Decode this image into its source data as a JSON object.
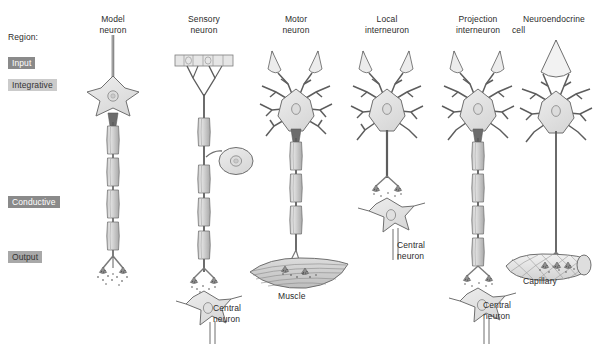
{
  "figure": {
    "title_prefix": "Region:",
    "background_color": "#ffffff",
    "ink_color": "#4a4a4a",
    "soma_fill": "#e2e2e2",
    "myelin_fill": "#cfcfcf"
  },
  "regions": [
    {
      "key": "input",
      "label": "Input",
      "chip_color": "#8a8a8a",
      "text_color": "#ffffff",
      "x": 8,
      "y": 57
    },
    {
      "key": "integrative",
      "label": "Integrative",
      "chip_color": "#cbcbcb",
      "text_color": "#333333",
      "x": 8,
      "y": 79
    },
    {
      "key": "conductive",
      "label": "Conductive",
      "chip_color": "#8a8a8a",
      "text_color": "#ffffff",
      "x": 8,
      "y": 196
    },
    {
      "key": "output",
      "label": "Output",
      "chip_color": "#a8a8a8",
      "text_color": "#333333",
      "x": 8,
      "y": 251
    }
  ],
  "columns": [
    {
      "key": "model-neuron",
      "line1": "Model",
      "line2": "neuron",
      "center_x": 113
    },
    {
      "key": "sensory-neuron",
      "line1": "Sensory",
      "line2": "neuron",
      "center_x": 204
    },
    {
      "key": "motor-neuron",
      "line1": "Motor",
      "line2": "neuron",
      "center_x": 296
    },
    {
      "key": "local-interneuron",
      "line1": "Local",
      "line2": "interneuron",
      "center_x": 387
    },
    {
      "key": "projection-interneuron",
      "line1": "Projection",
      "line2": "interneuron",
      "center_x": 478
    },
    {
      "key": "neuroendocrine-cell",
      "line1": "Neuroendocrine",
      "line2": "cell",
      "center_x": 556
    }
  ],
  "target_labels": [
    {
      "key": "central-neuron-sensory",
      "text": "Central\nneuron",
      "x": 213,
      "y": 303
    },
    {
      "key": "muscle",
      "text": "Muscle",
      "x": 278,
      "y": 290
    },
    {
      "key": "central-neuron-local",
      "text": "Central\nneuron",
      "x": 397,
      "y": 240
    },
    {
      "key": "central-neuron-projection",
      "text": "Central\nneuron",
      "x": 483,
      "y": 300
    },
    {
      "key": "capillary",
      "text": "Capillary",
      "x": 523,
      "y": 274
    }
  ]
}
